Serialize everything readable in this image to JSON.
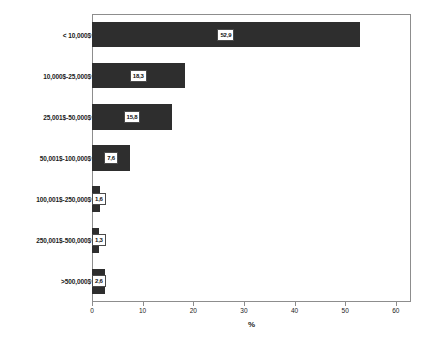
{
  "chart_data": {
    "type": "bar",
    "orientation": "horizontal",
    "title": "",
    "subtitle": "",
    "xlabel": "%",
    "ylabel": "",
    "xlim": [
      0,
      63
    ],
    "ylim": null,
    "grid": false,
    "legend": null,
    "bar_color": "#2e2e2e",
    "frame_color": "#8d8d8d",
    "categories": [
      "< 10,000$",
      "10,000$-25,000$",
      "25,001$-50,000$",
      "50,001$-100,000$",
      "100,001$-250,000$",
      "250,001$-500,000$",
      ">500,000$"
    ],
    "values": [
      52.9,
      18.3,
      15.8,
      7.6,
      1.6,
      1.3,
      2.6
    ],
    "value_labels": [
      "52,9",
      "18,3",
      "15,8",
      "7,6",
      "1,6",
      "1,3",
      "2,6"
    ],
    "xticks": [
      0,
      10,
      20,
      30,
      40,
      50,
      60
    ],
    "xticklabels": [
      "0",
      "10",
      "20",
      "30",
      "40",
      "50",
      "60"
    ]
  },
  "caption": {
    "fragment": ""
  }
}
